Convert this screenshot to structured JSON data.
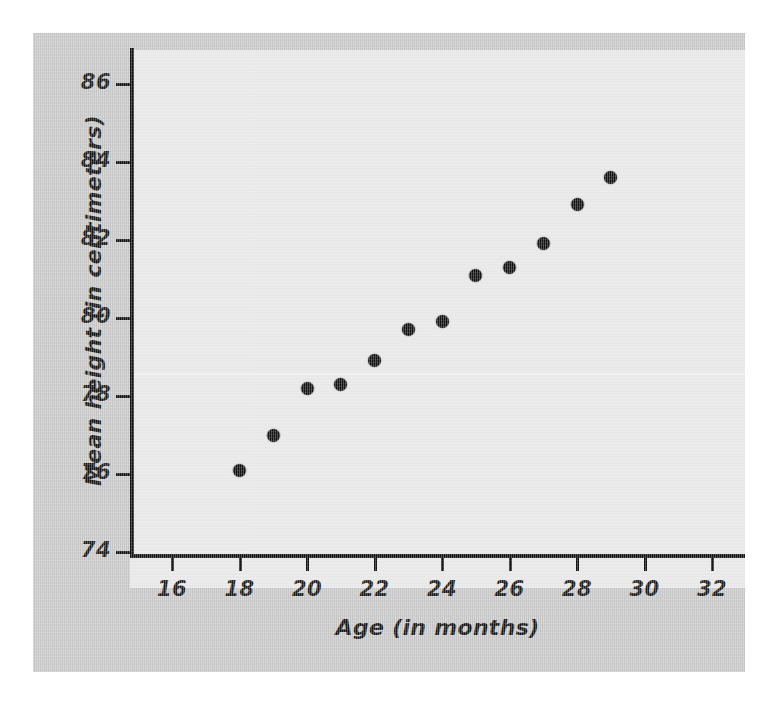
{
  "figure": {
    "background_color": "#c9c9c9",
    "panel_color": "#e6e6e6",
    "page_color": "#ffffff",
    "marker_color": "#111111",
    "axis_color": "#111111"
  },
  "chart_data": {
    "type": "scatter",
    "title": "",
    "xlabel": "Age (in months)",
    "ylabel": "Mean height (in centimeters)",
    "xlim": [
      15,
      33
    ],
    "ylim": [
      73,
      87
    ],
    "xticks": [
      16,
      18,
      20,
      22,
      24,
      26,
      28,
      30,
      32
    ],
    "yticks": [
      74,
      76,
      78,
      80,
      82,
      84,
      86
    ],
    "xtick_labels": [
      "16",
      "18",
      "20",
      "22",
      "24",
      "26",
      "28",
      "30",
      "32"
    ],
    "ytick_labels": [
      "74",
      "76",
      "78",
      "80",
      "82",
      "84",
      "86"
    ],
    "grid": false,
    "legend": null,
    "series": [
      {
        "name": "Mean height by age",
        "x": [
          18,
          19,
          20,
          21,
          22,
          23,
          24,
          25,
          26,
          27,
          28,
          29
        ],
        "y": [
          76.1,
          77.0,
          78.2,
          78.3,
          78.9,
          79.7,
          79.9,
          81.1,
          81.3,
          81.9,
          82.9,
          83.6
        ],
        "points": [
          {
            "x": 18,
            "y": 76.1
          },
          {
            "x": 19,
            "y": 77.0
          },
          {
            "x": 20,
            "y": 78.2
          },
          {
            "x": 21,
            "y": 78.3
          },
          {
            "x": 22,
            "y": 78.9
          },
          {
            "x": 23,
            "y": 79.7
          },
          {
            "x": 24,
            "y": 79.9
          },
          {
            "x": 25,
            "y": 81.1
          },
          {
            "x": 26,
            "y": 81.3
          },
          {
            "x": 27,
            "y": 81.9
          },
          {
            "x": 28,
            "y": 82.9
          },
          {
            "x": 29,
            "y": 83.6
          }
        ]
      }
    ]
  }
}
